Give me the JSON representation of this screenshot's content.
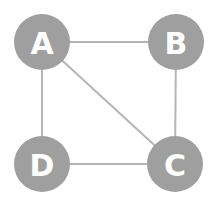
{
  "diagram": {
    "type": "undirected-graph",
    "colors": {
      "node_fill": "#9f9f9f",
      "node_text": "#ffffff",
      "edge": "#b5b5b5",
      "background": "#ffffff"
    },
    "nodes": [
      {
        "id": "A",
        "label": "A",
        "cx": 42,
        "cy": 42,
        "r": 28
      },
      {
        "id": "B",
        "label": "B",
        "cx": 176,
        "cy": 42,
        "r": 28
      },
      {
        "id": "C",
        "label": "C",
        "cx": 175,
        "cy": 164,
        "r": 28
      },
      {
        "id": "D",
        "label": "D",
        "cx": 42,
        "cy": 164,
        "r": 28
      }
    ],
    "edges": [
      {
        "from": "A",
        "to": "B"
      },
      {
        "from": "A",
        "to": "D"
      },
      {
        "from": "A",
        "to": "C"
      },
      {
        "from": "B",
        "to": "C"
      },
      {
        "from": "D",
        "to": "C"
      }
    ]
  }
}
